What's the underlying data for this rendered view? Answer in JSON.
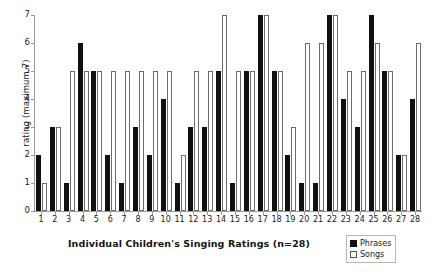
{
  "chart_data": {
    "type": "bar",
    "title": "",
    "xlabel": "Individual Children's Singing Ratings (n=28)",
    "ylabel": "rating (maximum 7)",
    "ylim": [
      0,
      7
    ],
    "yticks": [
      0,
      1,
      2,
      3,
      4,
      5,
      6,
      7
    ],
    "grid": false,
    "legend_position": "bottom-right",
    "categories": [
      "1",
      "2",
      "3",
      "4",
      "5",
      "6",
      "7",
      "8",
      "9",
      "10",
      "11",
      "12",
      "13",
      "14",
      "15",
      "16",
      "17",
      "18",
      "19",
      "20",
      "21",
      "22",
      "23",
      "24",
      "25",
      "26",
      "27",
      "28"
    ],
    "series": [
      {
        "name": "Phrases",
        "color": "#101010",
        "values": [
          2,
          3,
          1,
          6,
          5,
          2,
          1,
          3,
          2,
          4,
          1,
          3,
          3,
          5,
          1,
          5,
          7,
          5,
          2,
          1,
          1,
          7,
          4,
          3,
          7,
          5,
          2,
          4
        ]
      },
      {
        "name": "Songs",
        "color": "#ffffff",
        "values": [
          1,
          3,
          5,
          5,
          5,
          5,
          5,
          5,
          5,
          5,
          2,
          5,
          5,
          7,
          5,
          5,
          7,
          5,
          3,
          6,
          6,
          7,
          5,
          5,
          6,
          5,
          2,
          6
        ]
      }
    ]
  },
  "axis": {
    "y_title": "rating (maximum 7)",
    "x_title": "Individual Children's Singing Ratings (n=28)"
  },
  "legend": {
    "items": [
      {
        "label": "Phrases",
        "style": "filled"
      },
      {
        "label": "Songs",
        "style": "outlined"
      }
    ]
  }
}
